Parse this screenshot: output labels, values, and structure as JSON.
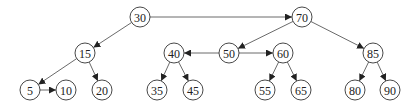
{
  "diagram": {
    "type": "tree",
    "nodes": [
      {
        "id": "n30",
        "label": "30",
        "x": 140,
        "y": 17
      },
      {
        "id": "n70",
        "label": "70",
        "x": 302,
        "y": 17
      },
      {
        "id": "n15",
        "label": "15",
        "x": 85,
        "y": 53
      },
      {
        "id": "n40",
        "label": "40",
        "x": 174,
        "y": 53
      },
      {
        "id": "n50",
        "label": "50",
        "x": 229,
        "y": 53
      },
      {
        "id": "n60",
        "label": "60",
        "x": 283,
        "y": 53
      },
      {
        "id": "n85",
        "label": "85",
        "x": 373,
        "y": 53
      },
      {
        "id": "n5",
        "label": "5",
        "x": 30,
        "y": 90
      },
      {
        "id": "n10",
        "label": "10",
        "x": 66,
        "y": 90
      },
      {
        "id": "n20",
        "label": "20",
        "x": 102,
        "y": 90
      },
      {
        "id": "n35",
        "label": "35",
        "x": 157,
        "y": 90
      },
      {
        "id": "n45",
        "label": "45",
        "x": 193,
        "y": 90
      },
      {
        "id": "n55",
        "label": "55",
        "x": 265,
        "y": 90
      },
      {
        "id": "n65",
        "label": "65",
        "x": 301,
        "y": 90
      },
      {
        "id": "n80",
        "label": "80",
        "x": 355,
        "y": 90
      },
      {
        "id": "n90",
        "label": "90",
        "x": 390,
        "y": 90
      }
    ],
    "edges": [
      {
        "from": "n30",
        "to": "n70"
      },
      {
        "from": "n30",
        "to": "n15"
      },
      {
        "from": "n70",
        "to": "n50"
      },
      {
        "from": "n70",
        "to": "n85"
      },
      {
        "from": "n15",
        "to": "n5"
      },
      {
        "from": "n15",
        "to": "n20"
      },
      {
        "from": "n5",
        "to": "n10"
      },
      {
        "from": "n50",
        "to": "n40"
      },
      {
        "from": "n50",
        "to": "n60"
      },
      {
        "from": "n40",
        "to": "n35"
      },
      {
        "from": "n40",
        "to": "n45"
      },
      {
        "from": "n60",
        "to": "n55"
      },
      {
        "from": "n60",
        "to": "n65"
      },
      {
        "from": "n85",
        "to": "n80"
      },
      {
        "from": "n85",
        "to": "n90"
      }
    ],
    "node_radius": 10,
    "colors": {
      "stroke": "#333333",
      "edge": "#444444",
      "fill": "#ffffff",
      "text": "#222222"
    }
  }
}
